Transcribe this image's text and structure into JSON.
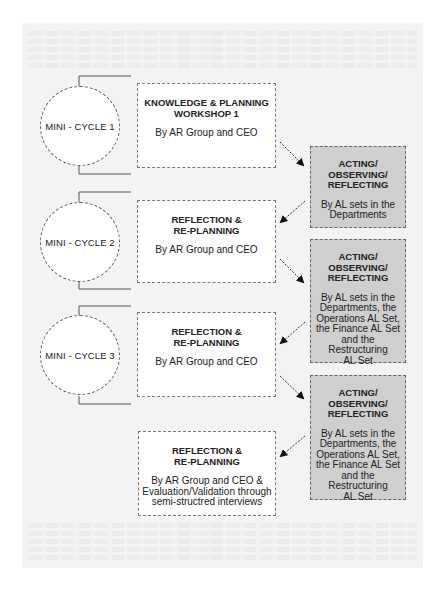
{
  "diagram": {
    "colors": {
      "background_panel": "#f3f3f3",
      "planning_box": "#ffffff",
      "acting_box": "#cfcfcf",
      "line": "#555555"
    },
    "cycles": [
      {
        "label": "MINI - CYCLE 1"
      },
      {
        "label": "MINI - CYCLE 2"
      },
      {
        "label": "MINI - CYCLE 3"
      }
    ],
    "planning_boxes": [
      {
        "title_line1": "KNOWLEDGE & PLANNING",
        "title_line2": "WORKSHOP 1",
        "sub": "By AR Group and CEO"
      },
      {
        "title_line1": "REFLECTION &",
        "title_line2": "RE-PLANNING",
        "sub": "By AR Group and CEO"
      },
      {
        "title_line1": "REFLECTION &",
        "title_line2": "RE-PLANNING",
        "sub": "By AR Group and CEO"
      },
      {
        "title_line1": "REFLECTION &",
        "title_line2": "RE-PLANNING",
        "sub_line1": "By AR Group and CEO &",
        "sub_line2": "Evaluation/Validation through",
        "sub_line3": "semi-structred interviews"
      }
    ],
    "acting_boxes": [
      {
        "title_line1": "ACTING/",
        "title_line2": "OBSERVING/",
        "title_line3": "REFLECTING",
        "sub_line1": "By AL sets in the",
        "sub_line2": "Departments"
      },
      {
        "title_line1": "ACTING/",
        "title_line2": "OBSERVING/",
        "title_line3": "REFLECTING",
        "sub_line1": "By AL sets in the",
        "sub_line2": "Departments, the",
        "sub_line3": "Operations AL Set,",
        "sub_line4": "the Finance AL Set",
        "sub_line5": "and the Restructuring",
        "sub_line6": "AL Set"
      },
      {
        "title_line1": "ACTING/",
        "title_line2": "OBSERVING/",
        "title_line3": "REFLECTING",
        "sub_line1": "By AL sets in the",
        "sub_line2": "Departments, the",
        "sub_line3": "Operations AL Set,",
        "sub_line4": "the Finance AL Set",
        "sub_line5": "and the Restructuring",
        "sub_line6": "AL Set"
      }
    ]
  }
}
